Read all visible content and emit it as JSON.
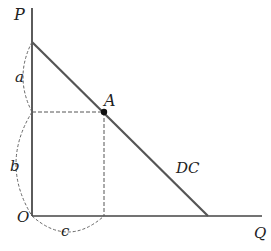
{
  "labels": {
    "y_axis": "P",
    "x_axis": "Q",
    "origin": "O",
    "point": "A",
    "curve": "DC",
    "brace_upper": "a",
    "brace_lower": "b",
    "brace_horizontal": "c"
  },
  "colors": {
    "line": "#555555",
    "axis": "#333333",
    "dash": "#555555"
  }
}
